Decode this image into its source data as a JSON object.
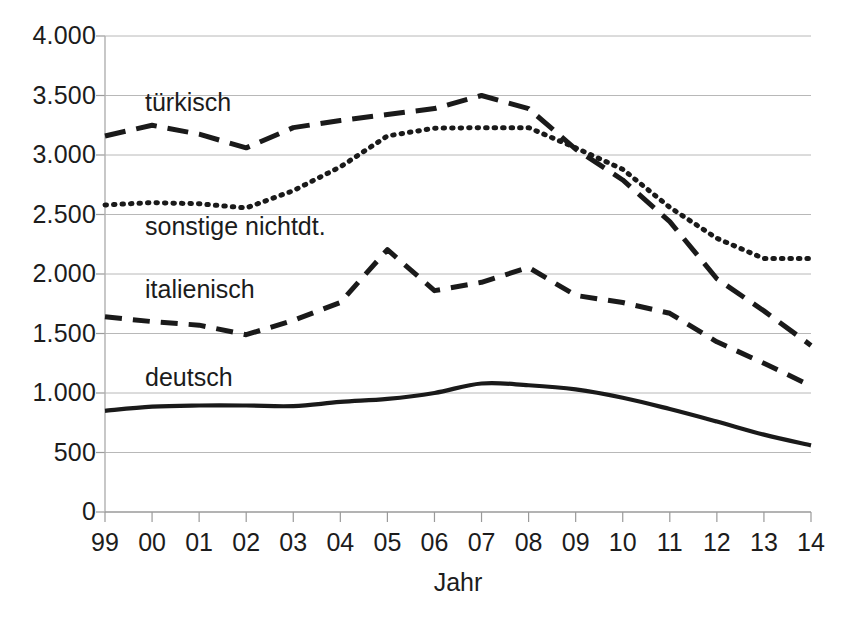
{
  "chart_data": {
    "type": "line",
    "title": "",
    "subtitle": "",
    "xlabel": "Jahr",
    "ylabel": "",
    "categories": [
      "99",
      "00",
      "01",
      "02",
      "03",
      "04",
      "05",
      "06",
      "07",
      "08",
      "09",
      "10",
      "11",
      "12",
      "13",
      "14"
    ],
    "ylim": [
      0,
      4000
    ],
    "ytick_values": [
      0,
      500,
      1000,
      1500,
      2000,
      2500,
      3000,
      3500,
      4000
    ],
    "ytick_labels": [
      "0",
      "500",
      "1.000",
      "1.500",
      "2.000",
      "2.500",
      "3.000",
      "3.500",
      "4.000"
    ],
    "grid": true,
    "grid_axis": "y",
    "legend": "inline-labels",
    "series": [
      {
        "name": "türkisch",
        "style": "long-dashed",
        "color": "#1a1a1a",
        "values": [
          3160,
          3250,
          3175,
          3060,
          3230,
          3290,
          3340,
          3390,
          3500,
          3390,
          3050,
          2790,
          2440,
          1960,
          1690,
          1400
        ]
      },
      {
        "name": "sonstige nichtdt.",
        "style": "dotted",
        "color": "#1a1a1a",
        "values": [
          2580,
          2600,
          2590,
          2555,
          2700,
          2900,
          3160,
          3225,
          3230,
          3230,
          3060,
          2880,
          2560,
          2300,
          2130,
          2130
        ]
      },
      {
        "name": "italienisch",
        "style": "dashed",
        "color": "#1a1a1a",
        "values": [
          1640,
          1600,
          1570,
          1490,
          1610,
          1760,
          2205,
          1860,
          1930,
          2055,
          1820,
          1760,
          1670,
          1430,
          1250,
          1060
        ]
      },
      {
        "name": "deutsch",
        "style": "solid",
        "color": "#1a1a1a",
        "values": [
          850,
          885,
          895,
          895,
          890,
          925,
          950,
          1000,
          1080,
          1065,
          1030,
          960,
          865,
          760,
          650,
          560
        ]
      }
    ],
    "series_label_positions": [
      {
        "name": "türkisch",
        "x": 145,
        "y": 90
      },
      {
        "name": "sonstige nichtdt.",
        "x": 145,
        "y": 214
      },
      {
        "name": "italienisch",
        "x": 145,
        "y": 277
      },
      {
        "name": "deutsch",
        "x": 145,
        "y": 365
      }
    ]
  }
}
